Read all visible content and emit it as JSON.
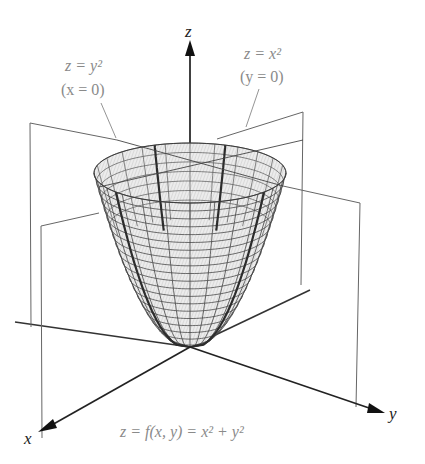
{
  "figure": {
    "axes": {
      "x_label": "x",
      "y_label": "y",
      "z_label": "z"
    },
    "annotations": {
      "left_trace": {
        "equation": "z = y²",
        "condition": "(x = 0)"
      },
      "right_trace": {
        "equation": "z = x²",
        "condition": "(y = 0)"
      }
    },
    "caption": "z = f(x, y) = x² + y²",
    "colors": {
      "axis": "#222222",
      "plane": "#555555",
      "mesh": "#444444",
      "surface_fill": "#e6e6e6",
      "trace": "#333333",
      "annotation_text": "#8a8a8a"
    },
    "surface": {
      "type": "paraboloid",
      "function": "x^2 + y^2",
      "rings": 20,
      "meridians": 24
    }
  }
}
